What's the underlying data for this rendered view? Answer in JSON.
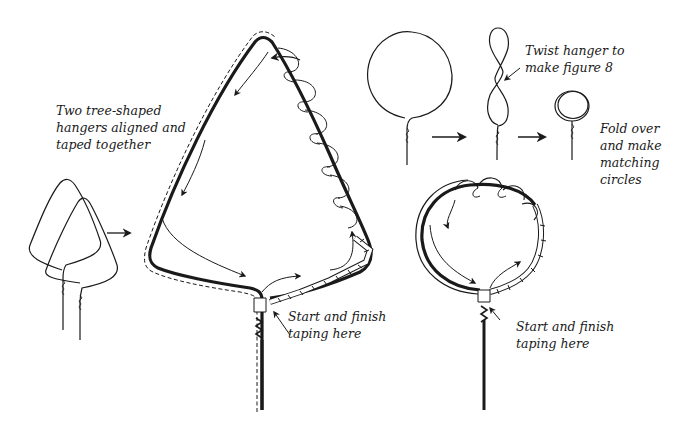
{
  "diagram": {
    "labels": {
      "two_hangers": "Two tree-shaped\nhangers aligned and\ntaped together",
      "twist_hanger": "Twist hanger to\nmake figure 8",
      "fold_over": "Fold over\nand make\nmatching\ncircles",
      "start_finish_tree": "Start and finish\ntaping here",
      "start_finish_circle": "Start and finish\ntaping here"
    },
    "steps": [
      {
        "name": "two-tree-hangers",
        "description": "Two tree-shaped hangers aligned and taped together"
      },
      {
        "name": "taped-tree-frame",
        "description": "Tree frame wrapped with tape"
      },
      {
        "name": "round-hanger",
        "description": "Hanger bent to circle"
      },
      {
        "name": "figure-eight-hanger",
        "description": "Twist hanger to make figure 8"
      },
      {
        "name": "folded-circle",
        "description": "Fold over and make matching circles"
      },
      {
        "name": "taped-circle-frame",
        "description": "Circle frame wrapped with tape"
      }
    ],
    "colors": {
      "ink": "#1a1a1a",
      "background": "#ffffff"
    }
  }
}
